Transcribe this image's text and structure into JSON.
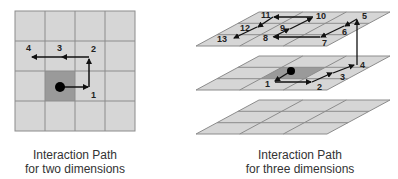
{
  "colors": {
    "cell_fill": "#d6d6d6",
    "cell_stroke": "#8c8c8c",
    "active_cell_fill": "#9a9a9a",
    "path": "#111111",
    "caption": "#333333"
  },
  "diagram_2d": {
    "caption_line1": "Interaction Path",
    "caption_line2": "for two dimensions",
    "grid": {
      "rows": 4,
      "cols": 4,
      "active_cell": [
        1,
        2
      ]
    },
    "path_points": [
      "start",
      "1",
      "2",
      "3",
      "4"
    ],
    "labels": {
      "p1": "1",
      "p2": "2",
      "p3": "3",
      "p4": "4"
    }
  },
  "diagram_3d": {
    "caption_line1": "Interaction Path",
    "caption_line2": "for three dimensions",
    "planes": 3,
    "grid_per_plane": {
      "rows": 3,
      "cols": 3
    },
    "active_plane": "middle",
    "path_points": [
      "start",
      "1",
      "2",
      "3",
      "4",
      "5",
      "6",
      "7",
      "8",
      "9",
      "10",
      "11",
      "12",
      "13"
    ],
    "labels": {
      "p1": "1",
      "p2": "2",
      "p3": "3",
      "p4": "4",
      "p5": "5",
      "p6": "6",
      "p7": "7",
      "p8": "8",
      "p9": "9",
      "p10": "10",
      "p11": "11",
      "p12": "12",
      "p13": "13"
    }
  }
}
